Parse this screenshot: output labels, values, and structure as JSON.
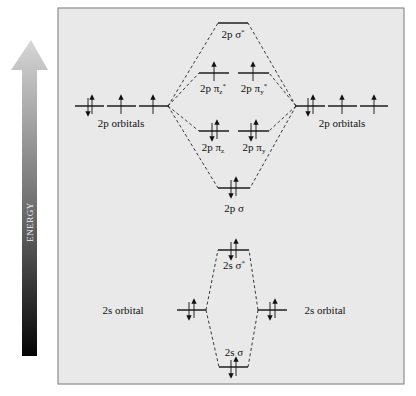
{
  "axis": {
    "label": "ENERGY",
    "direction": "up"
  },
  "panel": {
    "background": "#e8e8e8",
    "border": "#8a8a8a"
  },
  "left_atom": {
    "p_label": "2p orbitals",
    "p_electrons": [
      "up-down",
      "up",
      "up"
    ],
    "s_label": "2s orbital",
    "s_electrons": "up-down"
  },
  "right_atom": {
    "p_label": "2p orbitals",
    "p_electrons": [
      "up-down",
      "up",
      "up"
    ],
    "s_label": "2s orbital",
    "s_electrons": "up-down"
  },
  "molecular_orbitals": {
    "sigma2p_star": {
      "label_main": "2p σ",
      "label_sup": "*",
      "electrons": "none"
    },
    "pi2pz_star": {
      "label_main": "2p π",
      "label_sub": "z",
      "label_sup": "*",
      "electrons": "up"
    },
    "pi2py_star": {
      "label_main": "2p π",
      "label_sub": "y",
      "label_sup": "*",
      "electrons": "up"
    },
    "pi2pz": {
      "label_main": "2p π",
      "label_sub": "z",
      "electrons": "up-down"
    },
    "pi2py": {
      "label_main": "2p π",
      "label_sub": "y",
      "electrons": "up-down"
    },
    "sigma2p": {
      "label_main": "2p σ",
      "electrons": "up-down"
    },
    "sigma2s_star": {
      "label_main": "2s σ",
      "label_sup": "*",
      "electrons": "up-down"
    },
    "sigma2s": {
      "label_main": "2s σ",
      "electrons": "up-down"
    }
  }
}
